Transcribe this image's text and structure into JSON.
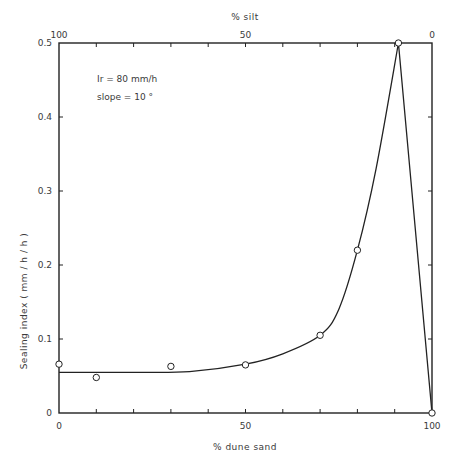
{
  "chart_data": {
    "type": "line",
    "title": "",
    "xlabel": "% dune sand",
    "x2label": "% silt",
    "ylabel": "Sealing   index   ( mm / h / h )",
    "xlim": [
      0,
      100
    ],
    "ylim": [
      0,
      0.5
    ],
    "grid": false,
    "legend": null,
    "x_ticks": [
      0,
      10,
      20,
      30,
      40,
      50,
      60,
      70,
      80,
      90,
      100
    ],
    "x_tick_labels": [
      {
        "value": 0,
        "label": "0"
      },
      {
        "value": 50,
        "label": "50"
      },
      {
        "value": 100,
        "label": "100"
      }
    ],
    "x2_tick_labels": [
      {
        "value": 0,
        "label": "100"
      },
      {
        "value": 50,
        "label": "50"
      },
      {
        "value": 100,
        "label": "0"
      }
    ],
    "y_ticks": [
      {
        "value": 0,
        "label": "0"
      },
      {
        "value": 0.1,
        "label": "0.1"
      },
      {
        "value": 0.2,
        "label": "0.2"
      },
      {
        "value": 0.3,
        "label": "0.3"
      },
      {
        "value": 0.4,
        "label": "0.4"
      },
      {
        "value": 0.5,
        "label": "0.5"
      }
    ],
    "annotations": [
      {
        "text": "Ir  =  80 mm/h",
        "x": 8,
        "y": 0.46
      },
      {
        "text": "slope  =  10 °",
        "x": 8,
        "y": 0.43
      }
    ],
    "series": [
      {
        "name": "observed",
        "marker": "open-circle",
        "points": [
          {
            "x": 0,
            "y": 0.066
          },
          {
            "x": 10,
            "y": 0.048
          },
          {
            "x": 30,
            "y": 0.063
          },
          {
            "x": 50,
            "y": 0.065
          },
          {
            "x": 70,
            "y": 0.105
          },
          {
            "x": 80,
            "y": 0.22
          },
          {
            "x": 91,
            "y": 0.5
          },
          {
            "x": 100,
            "y": 0.0
          }
        ]
      },
      {
        "name": "fitted-curve",
        "marker": "none",
        "points": [
          {
            "x": 0,
            "y": 0.055
          },
          {
            "x": 20,
            "y": 0.055
          },
          {
            "x": 35,
            "y": 0.056
          },
          {
            "x": 50,
            "y": 0.066
          },
          {
            "x": 60,
            "y": 0.08
          },
          {
            "x": 70,
            "y": 0.105
          },
          {
            "x": 75,
            "y": 0.14
          },
          {
            "x": 80,
            "y": 0.22
          },
          {
            "x": 85,
            "y": 0.33
          },
          {
            "x": 91,
            "y": 0.5
          },
          {
            "x": 100,
            "y": 0.0
          }
        ]
      }
    ]
  },
  "plot": {
    "left": 59,
    "right": 432,
    "top": 43,
    "bottom": 413,
    "line_color": "#222222",
    "marker_fill": "#ffffff"
  }
}
